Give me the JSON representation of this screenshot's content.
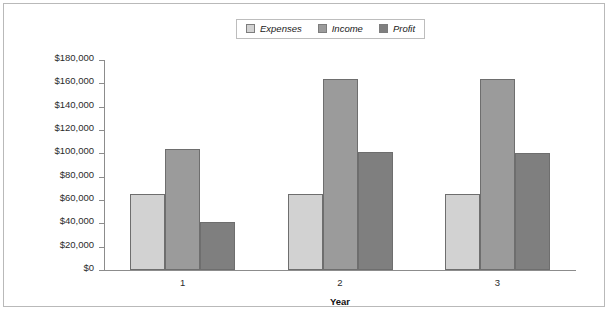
{
  "chart_data": {
    "type": "bar",
    "title": "",
    "xlabel": "Year",
    "ylabel": "",
    "categories": [
      "1",
      "2",
      "3"
    ],
    "series": [
      {
        "name": "Expenses",
        "color": "#d2d2d2",
        "values": [
          65000,
          65000,
          65000
        ]
      },
      {
        "name": "Income",
        "color": "#9b9b9b",
        "values": [
          104000,
          164000,
          164000
        ]
      },
      {
        "name": "Profit",
        "color": "#7f7f7f",
        "values": [
          41000,
          101000,
          100000
        ]
      }
    ],
    "ylim": [
      0,
      180000
    ],
    "ytick_step": 20000,
    "ytick_labels": [
      "$180,000",
      "$160,000",
      "$140,000",
      "$120,000",
      "$100,000",
      "$80,000",
      "$60,000",
      "$40,000",
      "$20,000",
      "$0"
    ],
    "grid": false,
    "legend_position": "top-center",
    "legend_entries": [
      "Expenses",
      "Income",
      "Profit"
    ],
    "border_color": "#b9b9b9",
    "axis_color": "#8c8c8c",
    "bar_border_color": "#6e6e6e"
  }
}
